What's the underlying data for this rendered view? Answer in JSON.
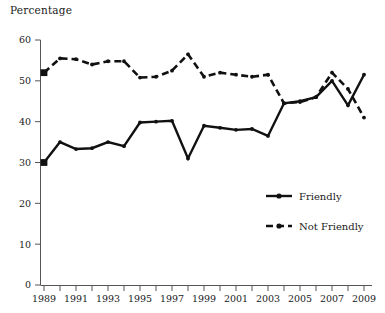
{
  "chart_data": {
    "type": "line",
    "title": "",
    "ylabel": "Percentage",
    "xlabel": "",
    "ylim": [
      0,
      60
    ],
    "ytick_step": 10,
    "yticks": [
      0,
      10,
      20,
      30,
      40,
      50,
      60
    ],
    "xlim": [
      1989,
      2009
    ],
    "x": [
      1989,
      1990,
      1991,
      1992,
      1993,
      1994,
      1995,
      1996,
      1997,
      1998,
      1999,
      2000,
      2001,
      2002,
      2003,
      2004,
      2005,
      2006,
      2007,
      2008,
      2009
    ],
    "xticks_all": [
      1989,
      1990,
      1991,
      1992,
      1993,
      1994,
      1995,
      1996,
      1997,
      1998,
      1999,
      2000,
      2001,
      2002,
      2003,
      2004,
      2005,
      2006,
      2007,
      2008,
      2009
    ],
    "xtick_labels": [
      "1989",
      "",
      "1991",
      "",
      "1993",
      "",
      "1995",
      "",
      "1997",
      "",
      "1999",
      "",
      "2001",
      "",
      "2003",
      "",
      "2005",
      "",
      "2007",
      "",
      "2009"
    ],
    "grid": false,
    "legend_position": "center-right-inside",
    "series": [
      {
        "name": "Friendly",
        "style": "solid",
        "color": "#111111",
        "values": [
          30.0,
          35.0,
          33.3,
          33.5,
          35.0,
          34.0,
          39.8,
          40.0,
          40.2,
          31.0,
          39.0,
          38.5,
          38.0,
          38.2,
          36.5,
          44.5,
          45.0,
          46.0,
          50.0,
          44.0,
          51.5
        ]
      },
      {
        "name": "Not Friendly",
        "style": "dashed",
        "color": "#111111",
        "values": [
          52.0,
          55.5,
          55.3,
          54.0,
          54.8,
          54.8,
          50.8,
          51.0,
          52.5,
          56.5,
          51.0,
          52.0,
          51.5,
          51.0,
          51.5,
          44.5,
          44.8,
          46.0,
          52.0,
          48.0,
          41.0
        ]
      }
    ],
    "legend": [
      {
        "label": "Friendly",
        "style": "solid"
      },
      {
        "label": "Not Friendly",
        "style": "dashed"
      }
    ]
  },
  "axis": {
    "ylabel_text": "Percentage"
  }
}
